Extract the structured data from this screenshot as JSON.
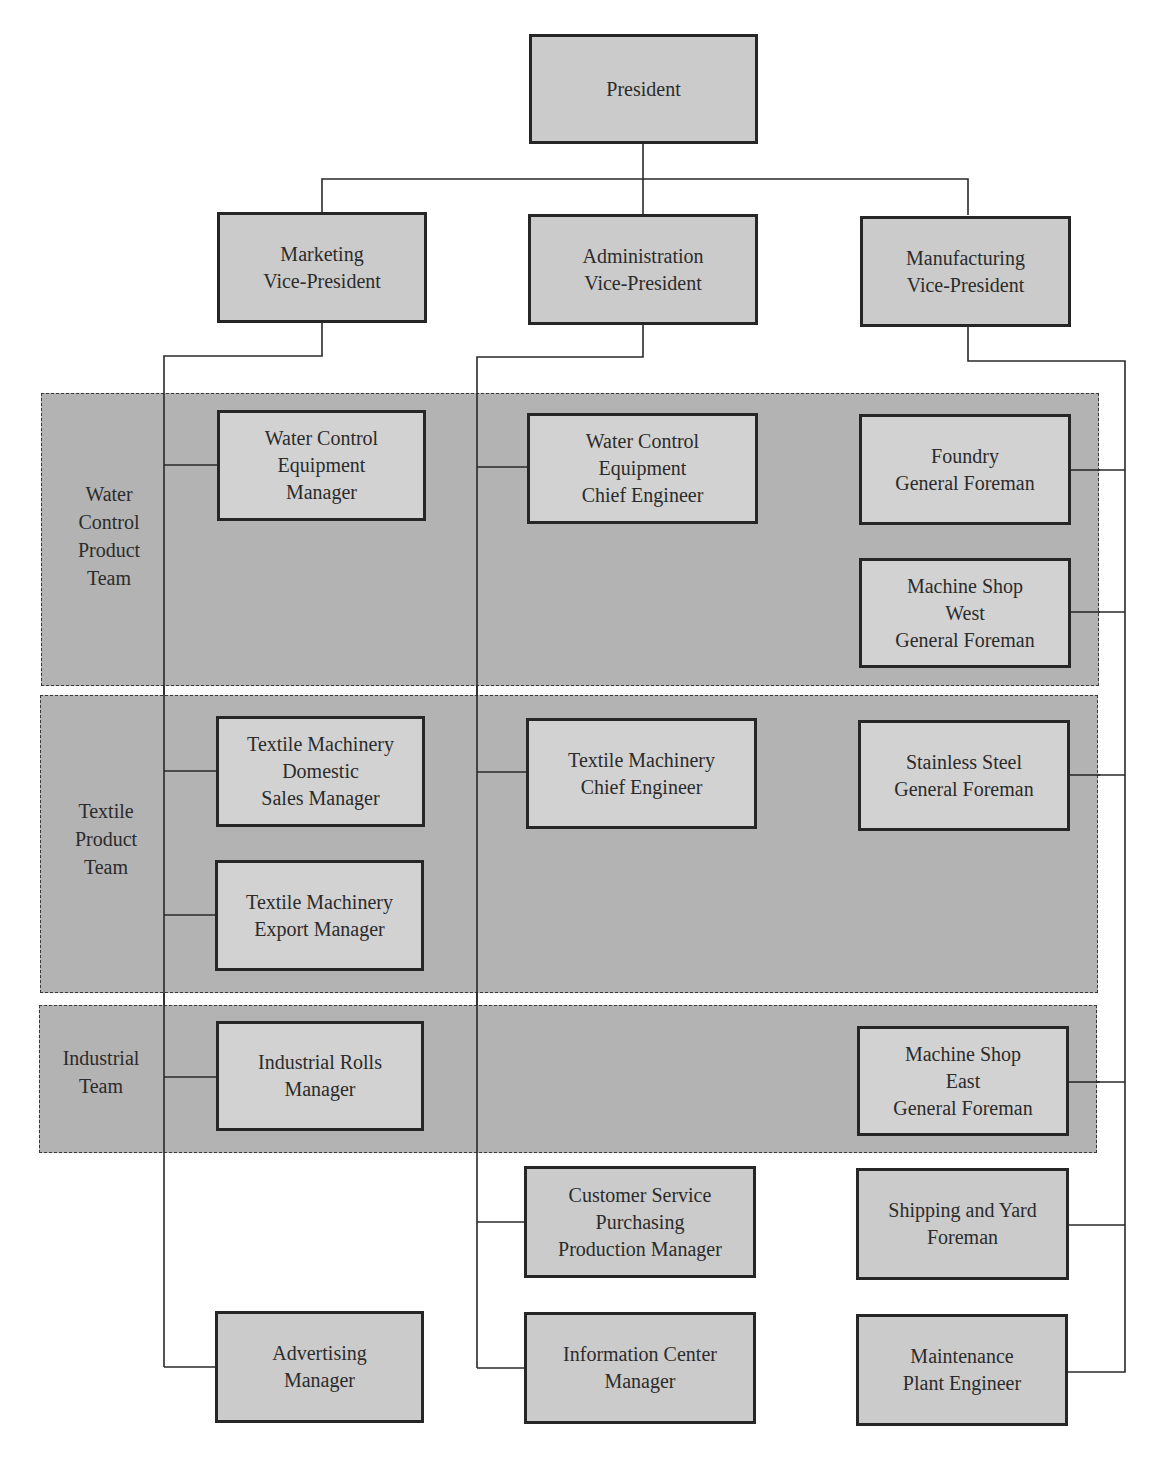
{
  "top": {
    "president": "President"
  },
  "vps": {
    "marketing": "Marketing\nVice-President",
    "administration": "Administration\nVice-President",
    "manufacturing": "Manufacturing\nVice-President"
  },
  "teams": [
    {
      "label": "Water\nControl\nProduct\nTeam",
      "marketing": [
        "Water Control\nEquipment\nManager"
      ],
      "administration": [
        "Water Control\nEquipment\nChief Engineer"
      ],
      "manufacturing": [
        "Foundry\nGeneral Foreman",
        "Machine Shop\nWest\nGeneral Foreman"
      ]
    },
    {
      "label": "Textile\nProduct\nTeam",
      "marketing": [
        "Textile Machinery\nDomestic\nSales Manager",
        "Textile Machinery\nExport Manager"
      ],
      "administration": [
        "Textile Machinery\nChief Engineer"
      ],
      "manufacturing": [
        "Stainless Steel\nGeneral Foreman"
      ]
    },
    {
      "label": "Industrial\nTeam",
      "marketing": [
        "Industrial Rolls\nManager"
      ],
      "administration": [],
      "manufacturing": [
        "Machine Shop\nEast\nGeneral Foreman"
      ]
    }
  ],
  "other": {
    "marketing": [
      "Advertising\nManager"
    ],
    "administration": [
      "Customer Service\nPurchasing\nProduction Manager",
      "Information Center\nManager"
    ],
    "manufacturing": [
      "Shipping and Yard\nForeman",
      "Maintenance\nPlant Engineer"
    ]
  },
  "colors": {
    "band_fill": "#b3b3b3",
    "box_fill": "#cbcbcb",
    "box_border": "#262626",
    "line": "#2a2a2a"
  }
}
